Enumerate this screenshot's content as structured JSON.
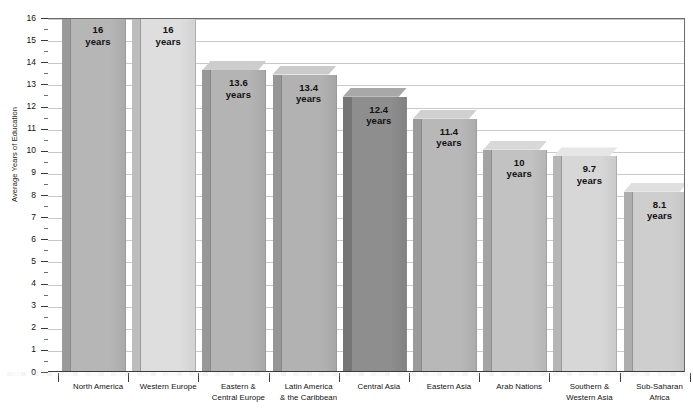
{
  "chart_data": {
    "type": "bar",
    "title": "",
    "subtitle": "",
    "xlabel": "",
    "ylabel": "Average Years of Education",
    "ylim": [
      0,
      16
    ],
    "ytick_step": 1,
    "grid": true,
    "legend": "none",
    "style": "3d-bars-grayscale",
    "categories": [
      "North America",
      "Western Europe",
      "Eastern &\nCentral Europe",
      "Latin America\n& the Caribbean",
      "Central Asia",
      "Eastern Asia",
      "Arab Nations",
      "Southern &\nWestern Asia",
      "Sub-Saharan\nAfrica"
    ],
    "values": [
      16,
      16,
      13.6,
      13.4,
      12.4,
      11.4,
      10,
      9.7,
      8.1
    ],
    "value_labels": [
      "16 years",
      "16 years",
      "13.6 years",
      "13.4 years",
      "12.4 years",
      "11.4 years",
      "10 years",
      "9.7 years",
      "8.1 years"
    ],
    "units": "years",
    "ytick_labels": [
      "0",
      "1",
      "2",
      "3",
      "4",
      "5",
      "6",
      "7",
      "8",
      "9",
      "10",
      "11",
      "12",
      "13",
      "14",
      "15",
      "16"
    ]
  },
  "axis": {
    "y_title": "Average Years of Education"
  },
  "bars": [
    {
      "category_line1": "North America",
      "category_line2": "",
      "value_number": "16",
      "value_unit": "years",
      "value": 16,
      "color_front": "#b6b6b6",
      "color_side": "#9a9a9a",
      "color_top": "#cfcfcf"
    },
    {
      "category_line1": "Western Europe",
      "category_line2": "",
      "value_number": "16",
      "value_unit": "years",
      "value": 16,
      "color_front": "#dedede",
      "color_side": "#bdbdbd",
      "color_top": "#ededed"
    },
    {
      "category_line1": "Eastern &",
      "category_line2": "Central Europe",
      "value_number": "13.6",
      "value_unit": "years",
      "value": 13.6,
      "color_front": "#b4b4b4",
      "color_side": "#989898",
      "color_top": "#cdcdcd"
    },
    {
      "category_line1": "Latin America",
      "category_line2": "& the Caribbean",
      "value_number": "13.4",
      "value_unit": "years",
      "value": 13.4,
      "color_front": "#b2b2b2",
      "color_side": "#969696",
      "color_top": "#cbcbcb"
    },
    {
      "category_line1": "Central Asia",
      "category_line2": "",
      "value_number": "12.4",
      "value_unit": "years",
      "value": 12.4,
      "color_front": "#8e8e8e",
      "color_side": "#757575",
      "color_top": "#a8a8a8"
    },
    {
      "category_line1": "Eastern Asia",
      "category_line2": "",
      "value_number": "11.4",
      "value_unit": "years",
      "value": 11.4,
      "color_front": "#b8b8b8",
      "color_side": "#9b9b9b",
      "color_top": "#d0d0d0"
    },
    {
      "category_line1": "Arab Nations",
      "category_line2": "",
      "value_number": "10",
      "value_unit": "years",
      "value": 10,
      "color_front": "#c2c2c2",
      "color_side": "#a4a4a4",
      "color_top": "#d8d8d8"
    },
    {
      "category_line1": "Southern &",
      "category_line2": "Western Asia",
      "value_number": "9.7",
      "value_unit": "years",
      "value": 9.7,
      "color_front": "#d7d7d7",
      "color_side": "#b6b6b6",
      "color_top": "#e6e6e6"
    },
    {
      "category_line1": "Sub-Saharan",
      "category_line2": "Africa",
      "value_number": "8.1",
      "value_unit": "years",
      "value": 8.1,
      "color_front": "#cecece",
      "color_side": "#adadad",
      "color_top": "#dfdfdf"
    }
  ]
}
